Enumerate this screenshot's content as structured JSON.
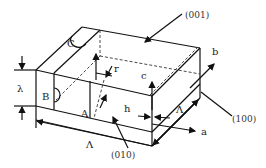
{
  "diagram": {
    "type": "crystal-block-schematic",
    "planes": {
      "top": "(001)",
      "right": "(100)",
      "front": "(010)"
    },
    "axes": {
      "a": "a",
      "b": "b",
      "c": "c"
    },
    "faces": {
      "top_face_label": "C",
      "side_face_label": "B",
      "front_step_label": "A"
    },
    "dimensions": {
      "thickness": "λ",
      "length": "Λ",
      "width": "Λ",
      "step_height": "h",
      "radius": "r"
    }
  }
}
